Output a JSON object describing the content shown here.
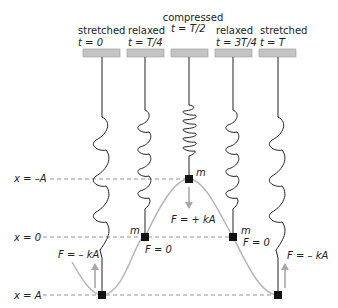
{
  "diagram": {
    "stages": [
      {
        "state": "stretched",
        "time": "t = 0"
      },
      {
        "state": "relaxed",
        "time": "t = T/4"
      },
      {
        "state": "compressed",
        "time": "t = T/2"
      },
      {
        "state": "relaxed",
        "time": "t = 3T/4"
      },
      {
        "state": "stretched",
        "time": "t = T"
      }
    ],
    "positions": {
      "neg_A": "x = –A",
      "zero": "x = 0",
      "pos_A": "x = A"
    },
    "mass_label": "m",
    "forces": {
      "f0": "F = – kA",
      "f1": "F = 0",
      "f2": "F = + kA",
      "f3": "F = 0",
      "f4": "F = – kA"
    },
    "colors": {
      "ceiling": "#c4c4c4",
      "curve": "#b5b5b5",
      "arrow": "#a8a8a8",
      "spring": "#222222",
      "dashed": "#888888"
    }
  }
}
